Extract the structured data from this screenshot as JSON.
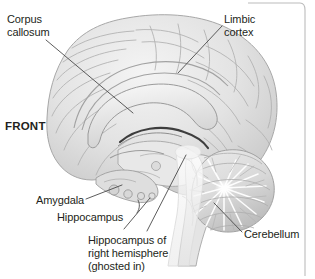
{
  "figure": {
    "orientation_marker": "FRONT",
    "style": "grayscale anatomical illustration",
    "border_color": "#bcbcbc",
    "ink_color": "#231f20",
    "leader_color": "#4a4a4a"
  },
  "labels": {
    "corpus_callosum_line1": "Corpus",
    "corpus_callosum_line2": "callosum",
    "limbic_cortex_line1": "Limbic",
    "limbic_cortex_line2": "cortex",
    "front": "FRONT",
    "amygdala": "Amygdala",
    "hippocampus": "Hippocampus",
    "ghosted_line1": "Hippocampus of",
    "ghosted_line2": "right hemisphere",
    "ghosted_line3": "(ghosted in)",
    "cerebellum": "Cerebellum"
  },
  "structures": [
    {
      "name": "Corpus callosum",
      "label_position": "top-left",
      "leader": true
    },
    {
      "name": "Limbic cortex",
      "label_position": "top-right",
      "leader": true
    },
    {
      "name": "Amygdala",
      "label_position": "bottom-left",
      "leader": true
    },
    {
      "name": "Hippocampus",
      "label_position": "bottom-left",
      "leader": true
    },
    {
      "name": "Hippocampus of right hemisphere (ghosted in)",
      "label_position": "bottom-center",
      "leader": true
    },
    {
      "name": "Cerebellum",
      "label_position": "bottom-right",
      "leader": true
    }
  ]
}
